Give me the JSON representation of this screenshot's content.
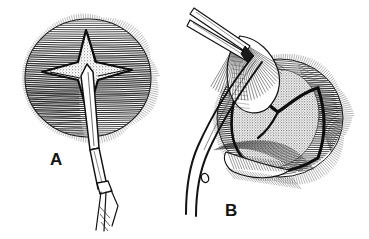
{
  "figure": {
    "kind": "medical-line-illustration",
    "technique": "pen-and-ink hatching with stipple shading",
    "background_color": "#ffffff",
    "ink_color": "#141414",
    "width": 369,
    "height": 239,
    "panel_count": 2,
    "caption_text": ""
  },
  "panels": [
    {
      "id": "A",
      "label": "A",
      "label_x": 50,
      "label_y": 151,
      "title": "cruciate-incision-being-made",
      "subject": "spherical-organ-with-cruciate-incision",
      "sphere": {
        "center_x": 88,
        "center_y": 78,
        "radius_x": 66,
        "radius_y": 62,
        "hatching": "horizontal-contour-lines",
        "fringe": "radial-bristle-border"
      },
      "incision": {
        "shape": "cruciate-four-point-star",
        "fill": "stipple",
        "center_x": 86,
        "center_y": 70
      },
      "instrument": {
        "name": "scalpel",
        "orientation": "vertical-angled-down-right",
        "tip_x": 88,
        "tip_y": 66,
        "handle_end_x": 102,
        "handle_end_y": 225
      }
    },
    {
      "id": "B",
      "label": "B",
      "label_x": 225,
      "label_y": 202,
      "title": "flap-retracted-exposing-contents",
      "subject": "spherical-organ-with-opened-flaps",
      "sphere": {
        "center_x": 280,
        "center_y": 118,
        "radius_x": 66,
        "radius_y": 62,
        "hatching": "curved-contour-lines",
        "fringe": "radial-bristle-border"
      },
      "exposed_mass": {
        "shape": "rounded-heart-dome",
        "fill": "stipple",
        "center_x": 275,
        "center_y": 118
      },
      "instruments": [
        {
          "name": "forceps",
          "orientation": "angled-upper-left",
          "tip_x": 245,
          "tip_y": 40,
          "handle_end_x": 192,
          "handle_end_y": 8,
          "prongs": 2
        },
        {
          "name": "curved-clamp",
          "orientation": "diagonal-upper-left-to-lower-left",
          "has_finger_ring_hole": true,
          "ring_x": 206,
          "ring_y": 178
        }
      ]
    }
  ],
  "labels": {
    "panel_a": "A",
    "panel_b": "B"
  },
  "colors": {
    "ink": "#141414",
    "background": "#ffffff",
    "stipple": "#8a8a8a",
    "light_hatch": "#5a5a5a"
  }
}
